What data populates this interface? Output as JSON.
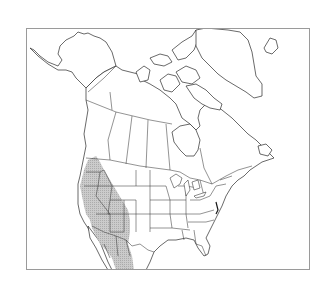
{
  "map": {
    "type": "species-range-map",
    "region": "North America",
    "frame": {
      "x": 26,
      "y": 28,
      "width": 284,
      "height": 242,
      "border_color": "#9a9a9a"
    },
    "colors": {
      "land_fill": "#ffffff",
      "outline": "#2a2a2a",
      "range_fill": "#bdbdbd",
      "background": "#ffffff"
    },
    "layers": [
      {
        "name": "coastlines",
        "style": "black outline"
      },
      {
        "name": "political-boundaries",
        "style": "thin black lines (US states, Canadian provinces, Mexico)"
      },
      {
        "name": "species-range",
        "style": "gray stipple",
        "extent": "Western US (WA, OR, ID, NV, UT, AZ, western CO, western NM, eastern CA) south through northwestern Mexico (Sonora, Chihuahua)"
      }
    ]
  }
}
